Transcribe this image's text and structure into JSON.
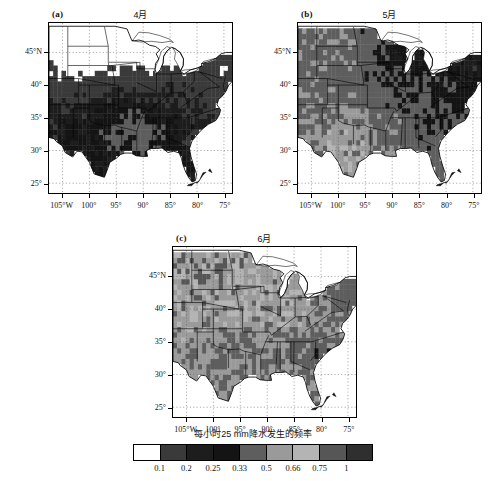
{
  "figure": {
    "panels": [
      {
        "tag": "(a)",
        "title": "4月",
        "month_index": 4,
        "x": 48,
        "y": 22,
        "w": 185,
        "h": 172
      },
      {
        "tag": "(b)",
        "title": "5月",
        "month_index": 5,
        "x": 297,
        "y": 22,
        "w": 185,
        "h": 172
      },
      {
        "tag": "(c)",
        "title": "6月",
        "month_index": 6,
        "x": 172,
        "y": 246,
        "w": 185,
        "h": 172
      }
    ],
    "axes": {
      "x_ticks": [
        "105°W",
        "100°",
        "95°",
        "90°",
        "85°",
        "80°",
        "75°"
      ],
      "x_values": [
        -105,
        -100,
        -95,
        -90,
        -85,
        -80,
        -75
      ],
      "y_ticks": [
        "45°N",
        "40°",
        "35°",
        "30°",
        "25°"
      ],
      "y_values": [
        45,
        40,
        35,
        30,
        25
      ],
      "xlim": [
        -107.5,
        -73.5
      ],
      "ylim": [
        23.5,
        49.5
      ]
    },
    "colorbar": {
      "title": "每小时25 mm降水发生的频率",
      "tick_labels": [
        "0.1",
        "0.2",
        "0.25",
        "0.33",
        "0.5",
        "0.66",
        "0.75",
        "1"
      ],
      "tick_values": [
        0.1,
        0.2,
        0.25,
        0.33,
        0.5,
        0.66,
        0.75,
        1
      ],
      "swatch_colors": [
        "#ffffff",
        "#3a3a3a",
        "#1d1d1d",
        "#141414",
        "#5e5e5e",
        "#9a9a9a",
        "#b4b4b4",
        "#565656",
        "#2f2f2f"
      ]
    }
  },
  "chart_data": {
    "type": "heatmap",
    "title": "每小时25 mm降水发生的频率",
    "subtitle": "",
    "xlabel": "",
    "ylabel": "",
    "grid": true,
    "legend_position": "bottom",
    "projection": "lambert-conformal-conic",
    "region": "Central and Eastern United States",
    "xlim": [
      -107.5,
      -73.5
    ],
    "ylim": [
      23.5,
      49.5
    ],
    "xtick_labels": [
      "105°W",
      "100°",
      "95°",
      "90°",
      "85°",
      "80°",
      "75°"
    ],
    "ytick_labels": [
      "45°N",
      "40°",
      "35°",
      "30°",
      "25°"
    ],
    "colorbar_levels": [
      0.1,
      0.2,
      0.25,
      0.33,
      0.5,
      0.66,
      0.75,
      1
    ],
    "colorbar_colors": [
      "#ffffff",
      "#3a3a3a",
      "#1d1d1d",
      "#141414",
      "#5e5e5e",
      "#9a9a9a",
      "#b4b4b4",
      "#565656",
      "#2f2f2f"
    ],
    "panels": [
      {
        "name": "(a) 4月",
        "description": "April; shading concentrated over the southern and south-eastern US, very little coverage north of 40°N.",
        "mean_value": 0.27,
        "coverage_fraction": 0.42,
        "regions": [
          {
            "region": "Texas / Gulf Coast",
            "value": 0.25
          },
          {
            "region": "Lower Mississippi Valley",
            "value": 0.5
          },
          {
            "region": "Southeast / Carolinas",
            "value": 0.2
          },
          {
            "region": "Ohio Valley",
            "value": 0.2
          },
          {
            "region": "Northern Plains",
            "value": 0.0
          },
          {
            "region": "Great Lakes",
            "value": 0.0
          },
          {
            "region": "Northeast",
            "value": 0.1
          }
        ]
      },
      {
        "name": "(b) 5月",
        "description": "May; shading expands north and west, covering the Plains and Midwest with moderate-to-high values over the southern Plains.",
        "mean_value": 0.42,
        "coverage_fraction": 0.78,
        "regions": [
          {
            "region": "Texas / Gulf Coast",
            "value": 0.66
          },
          {
            "region": "Lower Mississippi Valley",
            "value": 0.5
          },
          {
            "region": "Southeast / Carolinas",
            "value": 0.33
          },
          {
            "region": "Ohio Valley",
            "value": 0.33
          },
          {
            "region": "Northern Plains",
            "value": 0.5
          },
          {
            "region": "Great Lakes",
            "value": 0.2
          },
          {
            "region": "Northeast",
            "value": 0.2
          }
        ]
      },
      {
        "name": "(c) 6月",
        "description": "June; near-complete coverage of the domain with the highest frequencies over the Plains, Midwest and mid-Mississippi Valley.",
        "mean_value": 0.56,
        "coverage_fraction": 0.95,
        "regions": [
          {
            "region": "Texas / Gulf Coast",
            "value": 0.5
          },
          {
            "region": "Lower Mississippi Valley",
            "value": 0.5
          },
          {
            "region": "Southeast / Carolinas",
            "value": 0.33
          },
          {
            "region": "Ohio Valley",
            "value": 0.66
          },
          {
            "region": "Northern Plains",
            "value": 0.75
          },
          {
            "region": "Great Lakes",
            "value": 0.66
          },
          {
            "region": "Northeast",
            "value": 0.33
          }
        ]
      }
    ]
  }
}
